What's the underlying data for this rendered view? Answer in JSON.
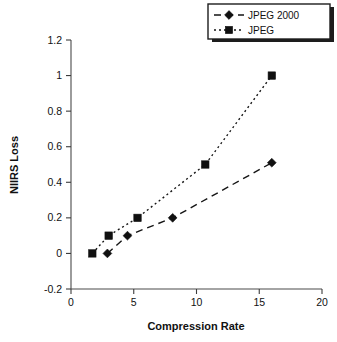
{
  "chart_data": {
    "type": "line",
    "title": "",
    "xlabel": "Compression Rate",
    "ylabel": "NIIRS Loss",
    "xlim": [
      0,
      20
    ],
    "ylim": [
      -0.2,
      1.2
    ],
    "xticks": [
      "0",
      "5",
      "10",
      "15",
      "20"
    ],
    "xtick_values": [
      0,
      5,
      10,
      15,
      20
    ],
    "yticks": [
      "1.2",
      "1",
      "0.8",
      "0.6",
      "0.4",
      "0.2",
      "0",
      "-0.2"
    ],
    "ytick_values": [
      1.2,
      1,
      0.8,
      0.6,
      0.4,
      0.2,
      0,
      -0.2
    ],
    "grid": false,
    "legend_position": "top-right",
    "series": [
      {
        "name": "JPEG 2000",
        "marker": "diamond",
        "linestyle": "dashed",
        "color": "#101010",
        "x": [
          2.9,
          4.5,
          8.1,
          16.0
        ],
        "y": [
          0.0,
          0.1,
          0.2,
          0.51
        ]
      },
      {
        "name": "JPEG",
        "marker": "square",
        "linestyle": "dotted",
        "color": "#101010",
        "x": [
          1.7,
          3.0,
          5.3,
          10.7,
          16.0
        ],
        "y": [
          0.0,
          0.1,
          0.2,
          0.5,
          1.0
        ]
      }
    ]
  },
  "legend": {
    "entries": [
      {
        "label": "JPEG 2000"
      },
      {
        "label": "JPEG"
      }
    ]
  }
}
